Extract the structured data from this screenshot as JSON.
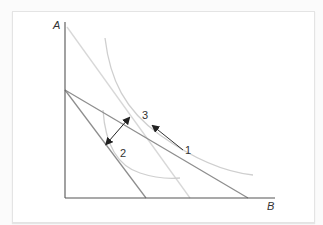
{
  "diagram": {
    "type": "economics-indifference-budget",
    "axis_labels": {
      "y": "A",
      "x": "B"
    },
    "point_labels": [
      {
        "id": "label-1",
        "text": "1"
      },
      {
        "id": "label-2",
        "text": "2"
      },
      {
        "id": "label-3",
        "text": "3"
      }
    ],
    "colors": {
      "axis": "#555555",
      "budget_line": "#8a8a8a",
      "light_line": "#d6d6d6",
      "curve": "#cccccc",
      "arrow": "#222222"
    }
  }
}
